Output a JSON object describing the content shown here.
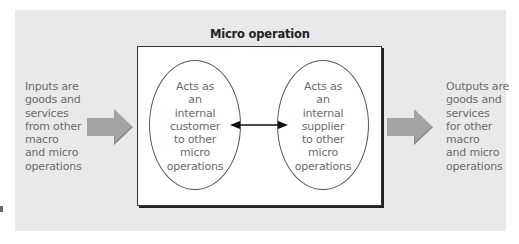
{
  "diagram": {
    "title": "Micro operation",
    "inputs_text": "Inputs are\ngoods and\nservices\nfrom other\nmacro\nand micro\noperations",
    "outputs_text": "Outputs are\ngoods and\nservices\nfor other\nmacro\nand micro\noperations",
    "left_ellipse_text": "Acts as\nan\ninternal\ncustomer\nto other\nmicro\noperations",
    "right_ellipse_text": "Acts as\nan\ninternal\nsupplier\nto other\nmicro\noperations",
    "colors": {
      "panel_bg": "#e9e9e9",
      "box_bg": "#ffffff",
      "arrow_fill": "#a3a3a3",
      "text": "#6b6b6b"
    }
  }
}
